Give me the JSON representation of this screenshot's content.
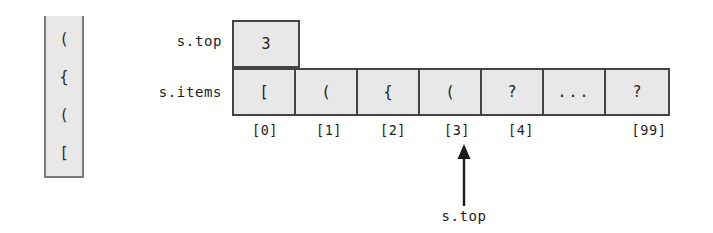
{
  "diagram": {
    "stack_container": {
      "name": "stack",
      "items_top_to_bottom": [
        "(",
        "{",
        "(",
        "["
      ]
    },
    "labels": {
      "top_field": "s.top",
      "items_field": "s.items"
    },
    "top_cell": {
      "value": "3"
    },
    "array": {
      "cells": [
        {
          "value": "[",
          "index_label": "[0]",
          "show_index": true
        },
        {
          "value": "(",
          "index_label": "[1]",
          "show_index": true
        },
        {
          "value": "{",
          "index_label": "[2]",
          "show_index": true
        },
        {
          "value": "(",
          "index_label": "[3]",
          "show_index": true
        },
        {
          "value": "?",
          "index_label": "[4]",
          "show_index": true
        },
        {
          "value": "...",
          "index_label": "",
          "show_index": false
        },
        {
          "value": "?",
          "index_label": "[99]",
          "show_index": true
        }
      ]
    },
    "pointer": {
      "caption": "s.top",
      "points_to_index_label": "[3]",
      "direction": "up"
    },
    "colors": {
      "cell_fill": "#e8e8e8",
      "cell_border": "#444444",
      "container_border": "#7b7b7b",
      "text": "#1c1c1c",
      "background": "#ffffff"
    }
  }
}
